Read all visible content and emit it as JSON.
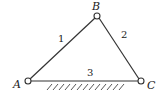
{
  "diagram": {
    "type": "triangular linkage (truss) with fixed ground link",
    "joints": [
      {
        "id": "A",
        "label": "A",
        "x": 28,
        "y": 81
      },
      {
        "id": "B",
        "label": "B",
        "x": 97,
        "y": 16
      },
      {
        "id": "C",
        "label": "C",
        "x": 141,
        "y": 81
      }
    ],
    "links": [
      {
        "id": "1",
        "label": "1",
        "from": "A",
        "to": "B"
      },
      {
        "id": "2",
        "label": "2",
        "from": "B",
        "to": "C"
      },
      {
        "id": "3",
        "label": "3",
        "from": "A",
        "to": "C",
        "grounded": true
      }
    ],
    "colors": {
      "line": "#333333",
      "text": "#222222",
      "background": "#ffffff"
    }
  }
}
